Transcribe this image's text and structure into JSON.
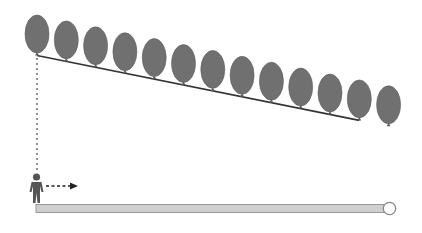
{
  "diagram": {
    "balloon_count": 13,
    "tethered_balloon_count": 12,
    "colors": {
      "balloon": "#707070",
      "balloon_shade": "#5f5f5f",
      "tether_line": "#333333",
      "dotted_line": "#555555",
      "person": "#555555",
      "arrow": "#222222",
      "ground_bar_fill": "#cfcfcf",
      "ground_bar_stroke": "#999999",
      "end_circle_fill": "#ffffff",
      "end_circle_stroke": "#888888"
    },
    "icons": {
      "person": "walking-person-icon",
      "arrow": "dashed-right-arrow-icon",
      "end_marker": "circle-marker-icon"
    }
  }
}
